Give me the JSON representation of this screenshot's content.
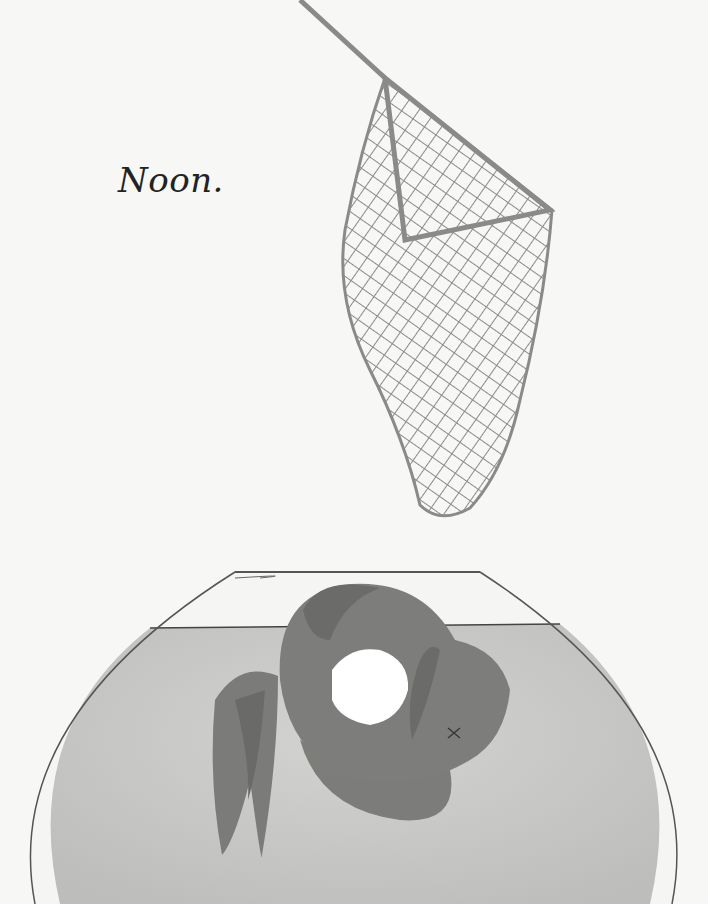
{
  "page": {
    "caption": "Noon.",
    "colors": {
      "background": "#f7f7f5",
      "water": "#c9c9c7",
      "fish": "#7d7d7b",
      "fish_dark": "#6b6b69",
      "net": "#8a8a88",
      "bowl_outline": "#555555"
    }
  },
  "illustration": {
    "elements": [
      "fishing-net",
      "fish-bowl",
      "goldfish-floating"
    ]
  }
}
